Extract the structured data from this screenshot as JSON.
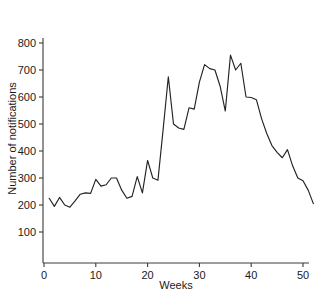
{
  "chart_data": {
    "type": "line",
    "title": "",
    "xlabel": "Weeks",
    "ylabel": "Number of notifications",
    "xlim": [
      0,
      52
    ],
    "ylim": [
      0,
      800
    ],
    "grid": false,
    "legend": null,
    "xticks": [
      0,
      10,
      20,
      30,
      40,
      50
    ],
    "xtick_labels": [
      "0",
      "10",
      "20",
      "30",
      "40",
      "50"
    ],
    "yticks": [
      100,
      200,
      300,
      400,
      500,
      600,
      700,
      800
    ],
    "ytick_labels": [
      "100",
      "200",
      "300",
      "400",
      "500",
      "600",
      "700",
      "800"
    ],
    "series": [
      {
        "name": "notifications",
        "color": "#232323",
        "x": [
          1,
          2,
          3,
          4,
          5,
          6,
          7,
          8,
          9,
          10,
          11,
          12,
          13,
          14,
          15,
          16,
          17,
          18,
          19,
          20,
          21,
          22,
          23,
          24,
          25,
          26,
          27,
          28,
          29,
          30,
          31,
          32,
          33,
          34,
          35,
          36,
          37,
          38,
          39,
          40,
          41,
          42,
          43,
          44,
          45,
          46,
          47,
          48,
          49,
          50,
          51,
          52
        ],
        "values": [
          225,
          195,
          228,
          200,
          192,
          215,
          240,
          245,
          243,
          295,
          270,
          275,
          300,
          300,
          255,
          225,
          232,
          305,
          245,
          365,
          300,
          292,
          480,
          675,
          500,
          485,
          480,
          560,
          555,
          655,
          720,
          705,
          700,
          640,
          548,
          755,
          700,
          725,
          600,
          598,
          590,
          520,
          465,
          420,
          395,
          375,
          405,
          345,
          300,
          290,
          255,
          205
        ]
      }
    ]
  },
  "axis": {
    "x_title": "Weeks",
    "y_title": "Number of notifications"
  }
}
